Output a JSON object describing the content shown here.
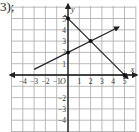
{
  "prefix_label": "3);",
  "chart_data": {
    "type": "line",
    "title": "",
    "xlabel": "x",
    "ylabel": "y",
    "origin_label": "O",
    "xlim": [
      -4.7,
      5.6
    ],
    "ylim": [
      -4.8,
      5.6
    ],
    "grid": true,
    "x_ticks": [
      -4,
      -3,
      -2,
      -1,
      1,
      2,
      3,
      4,
      5
    ],
    "x_tick_labels": [
      "−4",
      "−3",
      "−2",
      "−1",
      "1",
      "2",
      "3",
      "4",
      "5"
    ],
    "y_ticks": [
      5,
      4,
      3,
      2,
      1,
      -2,
      -3,
      -4
    ],
    "y_tick_labels": [
      "5",
      "4",
      "3",
      "2",
      "1",
      "−2",
      "−3",
      "−4"
    ],
    "series": [
      {
        "name": "line-1",
        "equation": "y = -x + 5",
        "from": [
          -0.3,
          5.3
        ],
        "to": [
          5.3,
          -0.3
        ],
        "arrow": "both"
      },
      {
        "name": "line-2",
        "equation": "y = 0.5x + 2",
        "from": [
          -3,
          0.5
        ],
        "to": [
          4.5,
          4.25
        ],
        "arrow": "end"
      }
    ],
    "points": [
      {
        "name": "y-intercept-line-1",
        "x": 0,
        "y": 5
      },
      {
        "name": "y-intercept-line-2",
        "x": 0,
        "y": 2
      },
      {
        "name": "intersection",
        "x": 2,
        "y": 3
      },
      {
        "name": "x-intercept-line-1",
        "x": 5,
        "y": 0
      }
    ]
  }
}
